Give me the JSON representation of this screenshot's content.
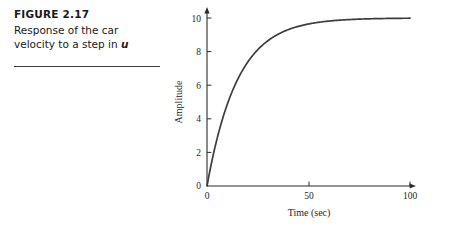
{
  "caption": {
    "figure_number": "FIGURE 2.17",
    "line1": "Response of the car",
    "line2_prefix": "velocity to a step in ",
    "line2_symbol": "u"
  },
  "chart_data": {
    "type": "line",
    "title": "",
    "xlabel": "Time (sec)",
    "ylabel": "Amplitude",
    "xlim": [
      0,
      105
    ],
    "ylim": [
      0,
      10.5
    ],
    "xticks": [
      0,
      50,
      100
    ],
    "xticklabels": [
      "0",
      "50",
      "100"
    ],
    "yticks": [
      0,
      2,
      4,
      6,
      8,
      10
    ],
    "yticklabels": [
      "0",
      "2",
      "4",
      "6",
      "8",
      "10"
    ],
    "grid": false,
    "legend": null,
    "series": [
      {
        "name": "step response",
        "color": "#3d3d3d",
        "steady_state": 10,
        "time_constant": 15,
        "x": [
          0,
          1,
          2,
          3,
          4,
          5,
          6,
          8,
          10,
          12,
          14,
          16,
          18,
          20,
          24,
          28,
          32,
          36,
          40,
          45,
          50,
          55,
          60,
          65,
          70,
          75,
          80,
          85,
          90,
          95,
          100
        ],
        "y": [
          0.0,
          0.65,
          1.25,
          1.81,
          2.34,
          2.83,
          3.3,
          4.13,
          4.87,
          5.51,
          6.07,
          6.57,
          7.01,
          7.36,
          7.99,
          8.45,
          8.81,
          9.08,
          9.29,
          9.49,
          9.64,
          9.74,
          9.82,
          9.87,
          9.9,
          9.93,
          9.95,
          9.96,
          9.97,
          9.98,
          9.99
        ]
      }
    ]
  }
}
